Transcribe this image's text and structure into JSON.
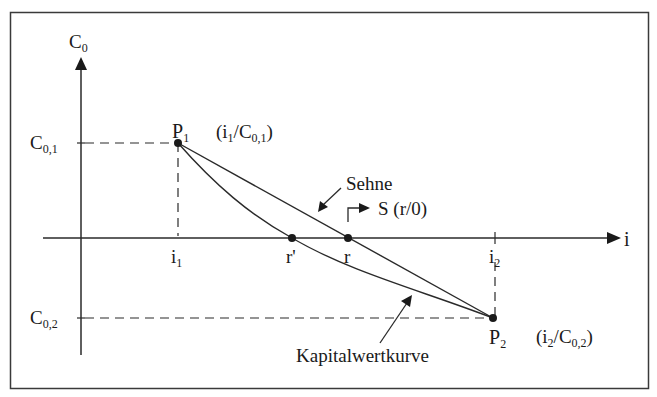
{
  "diagram": {
    "axes": {
      "y_label": {
        "main": "C",
        "sub": "0"
      },
      "x_label": "i"
    },
    "y_ticks": [
      {
        "main": "C",
        "sub": "0,1"
      },
      {
        "main": "C",
        "sub": "0,2"
      }
    ],
    "x_ticks": [
      {
        "main": "i",
        "sub": "1"
      },
      {
        "main": "r'",
        "sub": ""
      },
      {
        "main": "r",
        "sub": ""
      },
      {
        "main": "i",
        "sub": "2"
      }
    ],
    "points": {
      "p1": {
        "main": "P",
        "sub": "1",
        "coord_pre": "(i",
        "coord_sub1": "1",
        "coord_mid": "/C",
        "coord_sub2": "0,1",
        "coord_post": ")"
      },
      "p2": {
        "main": "P",
        "sub": "2",
        "coord_pre": "(i",
        "coord_sub1": "2",
        "coord_mid": "/C",
        "coord_sub2": "0,2",
        "coord_post": ")"
      },
      "s": {
        "label": "S (r/0)"
      }
    },
    "annotations": {
      "chord": "Sehne",
      "curve": "Kapitalwertkurve"
    },
    "colors": {
      "line": "#2a2a2a",
      "frame": "#3a3a3a",
      "background": "#ffffff"
    }
  }
}
